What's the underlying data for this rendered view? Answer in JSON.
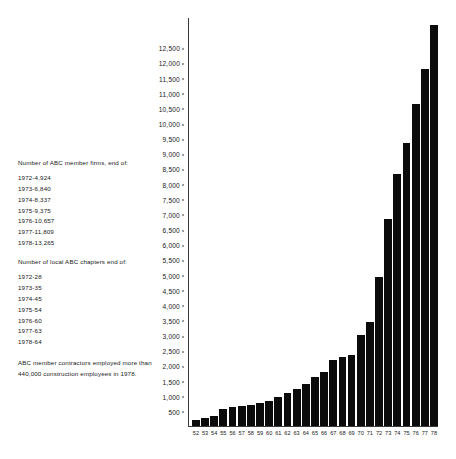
{
  "chart_data": {
    "type": "bar",
    "title": "",
    "subtitle": "",
    "xlabel": "",
    "ylabel": "",
    "ylim": [
      0,
      13500
    ],
    "grid": false,
    "legend": "none",
    "categories": [
      "52",
      "53",
      "54",
      "55",
      "56",
      "57",
      "58",
      "59",
      "60",
      "61",
      "62",
      "63",
      "64",
      "65",
      "66",
      "67",
      "68",
      "69",
      "70",
      "71",
      "72",
      "73",
      "74",
      "75",
      "76",
      "77",
      "78"
    ],
    "series": [
      {
        "name": "Number of ABC member firms",
        "values": [
          190,
          260,
          330,
          560,
          620,
          660,
          700,
          760,
          830,
          960,
          1080,
          1220,
          1400,
          1620,
          1800,
          2190,
          2290,
          2350,
          3000,
          3440,
          4924,
          6840,
          8337,
          9375,
          10657,
          11809,
          13265
        ]
      }
    ],
    "y_tick_labels": [
      "12,500",
      "12,000",
      "11,500",
      "11,000",
      "10,500",
      "10,000",
      "9,500",
      "9,000",
      "8,500",
      "8,000",
      "7,500",
      "7,000",
      "6,500",
      "6,000",
      "5,500",
      "5,000",
      "4,500",
      "4,000",
      "3,500",
      "3,000",
      "2,500",
      "2,000",
      "1,500",
      "1,000",
      "500"
    ],
    "y_tick_values": [
      12500,
      12000,
      11500,
      11000,
      10500,
      10000,
      9500,
      9000,
      8500,
      8000,
      7500,
      7000,
      6500,
      6000,
      5500,
      5000,
      4500,
      4000,
      3500,
      3000,
      2500,
      2000,
      1500,
      1000,
      500
    ],
    "bar_color": "#0b0b0b",
    "axis_color": "#3a3a3a"
  },
  "notes": {
    "firms_heading": "Number of ABC member firms, end of:",
    "firms_rows": [
      "1972-4,924",
      "1973-6,840",
      "1974-8,337",
      "1975-9,375",
      "1976-10,657",
      "1977-11,809",
      "1978-13,265"
    ],
    "chapters_heading": "Number of local ABC chapters end of:",
    "chapters_rows": [
      "1972-28",
      "1973-35",
      "1974-45",
      "1975-54",
      "1976-60",
      "1977-63",
      "1978-64"
    ],
    "footnote": "ABC member contractors employed more than 440,000 construction employees in 1978."
  }
}
